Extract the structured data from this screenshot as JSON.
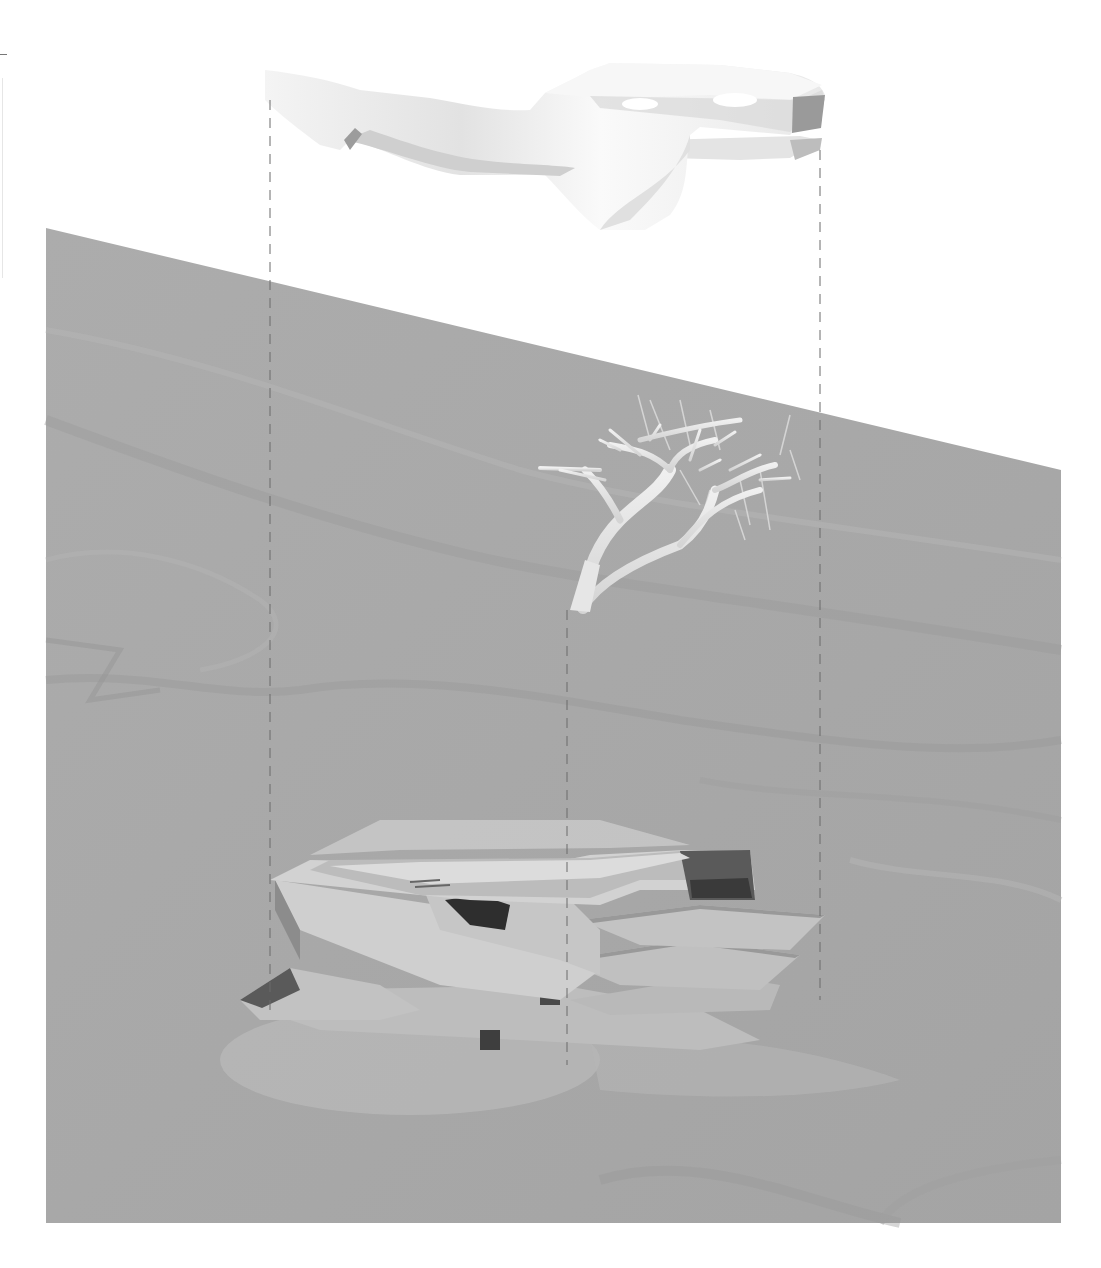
{
  "diagram": {
    "type": "exploded-axonometric",
    "layers": [
      {
        "id": "roof",
        "label": "roof-canopy"
      },
      {
        "id": "structure",
        "label": "branching-structure"
      },
      {
        "id": "building",
        "label": "terraced-building"
      },
      {
        "id": "ground",
        "label": "terrain-plane"
      }
    ],
    "projection_lines": {
      "count": 3,
      "style": "dashed"
    },
    "colors": {
      "background": "#ffffff",
      "terrain": "#a9a9a9",
      "terrain_dark": "#9a9a9a",
      "terrain_light": "#b8b8b8",
      "model_white": "#f2f2f2",
      "model_shadow": "#c9c9c9",
      "dark_void": "#3a3a3a",
      "projection_line": "#666666"
    }
  }
}
